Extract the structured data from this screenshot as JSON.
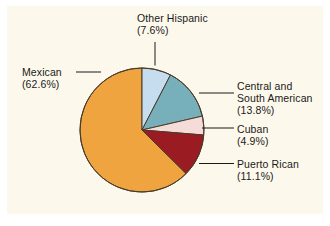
{
  "figure": {
    "background_color": "#ffffff",
    "panel_color": "#fdf8ec",
    "width": 330,
    "height": 226
  },
  "chart_data": {
    "type": "pie",
    "title": "",
    "subtitle": "",
    "xlabel": "",
    "ylabel": "",
    "grid": false,
    "legend_position": "callout-labels",
    "start_angle_deg": 90,
    "direction": "clockwise",
    "units": "percent",
    "center": {
      "x": 142,
      "y": 130
    },
    "radius": 62,
    "categories": [
      "Other Hispanic",
      "Central and South American",
      "Cuban",
      "Puerto Rican",
      "Mexican"
    ],
    "values": [
      7.6,
      13.8,
      4.9,
      11.1,
      62.6
    ],
    "colors": [
      "#c5ddee",
      "#77b0bb",
      "#f5dcd8",
      "#9b1b22",
      "#efa440"
    ],
    "slice_edge_color": "#4a3b2a",
    "slices": [
      {
        "label": "Other Hispanic",
        "value": 7.6,
        "value_text": "(7.6%)",
        "color": "#c5ddee",
        "label_lines": [
          "Other Hispanic",
          "(7.6%)"
        ]
      },
      {
        "label": "Central and South American",
        "value": 13.8,
        "value_text": "(13.8%)",
        "color": "#77b0bb",
        "label_lines": [
          "Central and",
          "South American",
          "(13.8%)"
        ]
      },
      {
        "label": "Cuban",
        "value": 4.9,
        "value_text": "(4.9%)",
        "color": "#f5dcd8",
        "label_lines": [
          "Cuban",
          "(4.9%)"
        ]
      },
      {
        "label": "Puerto Rican",
        "value": 11.1,
        "value_text": "(11.1%)",
        "color": "#9b1b22",
        "label_lines": [
          "Puerto Rican",
          "(11.1%)"
        ]
      },
      {
        "label": "Mexican",
        "value": 62.6,
        "value_text": "(62.6%)",
        "color": "#efa440",
        "label_lines": [
          "Mexican",
          "(62.6%)"
        ]
      }
    ]
  },
  "labels": {
    "other_hispanic": {
      "name": "Other Hispanic",
      "percent": "(7.6%)"
    },
    "central_south_american": {
      "line1": "Central and",
      "line2": "South American",
      "percent": "(13.8%)"
    },
    "cuban": {
      "name": "Cuban",
      "percent": "(4.9%)"
    },
    "puerto_rican": {
      "name": "Puerto Rican",
      "percent": "(11.1%)"
    },
    "mexican": {
      "name": "Mexican",
      "percent": "(62.6%)"
    }
  }
}
